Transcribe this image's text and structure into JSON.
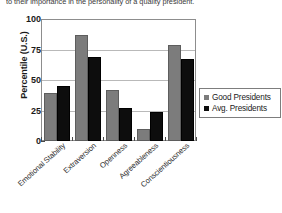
{
  "caption": {
    "text": "to their importance in the personality of a quality president."
  },
  "chart_data": {
    "type": "bar",
    "title": "",
    "xlabel": "",
    "ylabel": "Percentile (U.S.)",
    "ylim": [
      0,
      100
    ],
    "yticks": [
      0,
      25,
      50,
      75,
      100
    ],
    "grid": true,
    "legend_position": "right",
    "categories": [
      "Emotional Stability",
      "Extraversion",
      "Openness",
      "Agreeableness",
      "Conscientiousness"
    ],
    "series": [
      {
        "name": "Good Presidents",
        "color": "#7c7c7c",
        "values": [
          39,
          87,
          42,
          10,
          79
        ]
      },
      {
        "name": "Avg. Presidents",
        "color": "#0d0d0d",
        "values": [
          45,
          69,
          27,
          24,
          67
        ]
      }
    ]
  }
}
